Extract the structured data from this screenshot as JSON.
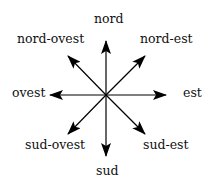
{
  "diagram": {
    "center": [
      106,
      95
    ],
    "labels": {
      "n": "nord",
      "ne": "nord-est",
      "e": "est",
      "se": "sud-est",
      "s": "sud",
      "sw": "sud-ovest",
      "w": "ovest",
      "nw": "nord-ovest"
    }
  }
}
